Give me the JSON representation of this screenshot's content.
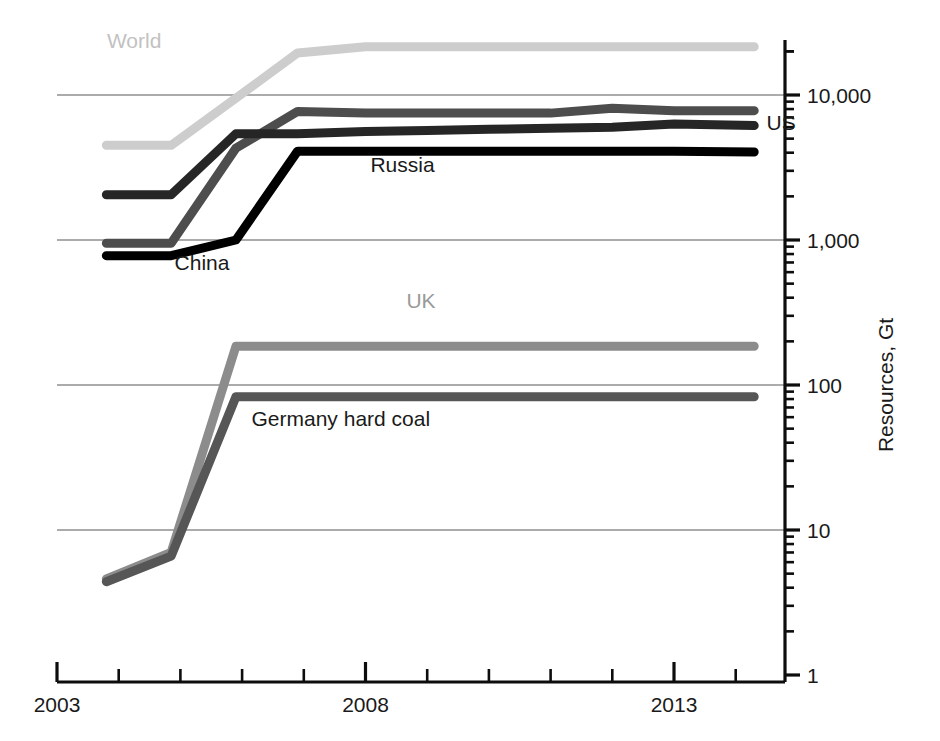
{
  "chart_data": {
    "type": "line",
    "title": "",
    "subtitle": "",
    "xlabel": "",
    "ylabel": "Resources, Gt",
    "y_scale": "log",
    "ylim": [
      1,
      30000
    ],
    "xlim": [
      2003,
      2014.6
    ],
    "grid": true,
    "grid_axis": "y",
    "legend_position": "inline-labels",
    "y_tick_labels": [
      "10,000",
      "1,000",
      "100",
      "10",
      "1"
    ],
    "y_tick_values": [
      10000,
      1000,
      100,
      10,
      1
    ],
    "x_tick_labels": [
      "2003",
      "2008",
      "2013"
    ],
    "x_tick_values": [
      2003,
      2008,
      2013
    ],
    "x_minor_ticks": [
      2004,
      2005,
      2006,
      2007,
      2009,
      2010,
      2011,
      2012,
      2014
    ],
    "series": [
      {
        "name": "World",
        "label": "World",
        "color": "#cdcdcd",
        "label_color": "#c2c2c2",
        "label_x": 2004.25,
        "label_y": 21000,
        "x": [
          2003.8,
          2004.85,
          2005.9,
          2006.9,
          2008.0,
          2009.0,
          2010.0,
          2011.0,
          2012.0,
          2013.0,
          2014.3
        ],
        "y": [
          4500,
          4500,
          9500,
          19500,
          21500,
          21500,
          21500,
          21500,
          21500,
          21500,
          21500
        ]
      },
      {
        "name": "Russia",
        "label": "Russia",
        "color": "#4d4d4d",
        "label_color": "#1a1a1a",
        "label_x": 2008.6,
        "label_y": 2950,
        "x": [
          2003.8,
          2004.85,
          2005.9,
          2006.9,
          2008.0,
          2009.0,
          2010.0,
          2011.0,
          2012.0,
          2013.0,
          2014.3
        ],
        "y": [
          950,
          950,
          4300,
          7700,
          7500,
          7500,
          7500,
          7500,
          8100,
          7800,
          7800
        ]
      },
      {
        "name": "US",
        "label": "US",
        "color": "#262626",
        "label_color": "#1a1a1a",
        "label_x": 2014.5,
        "label_y": 5700,
        "x": [
          2003.8,
          2004.85,
          2005.9,
          2006.9,
          2008.0,
          2009.0,
          2010.0,
          2011.0,
          2012.0,
          2013.0,
          2014.3
        ],
        "y": [
          2050,
          2050,
          5400,
          5400,
          5600,
          5700,
          5800,
          5900,
          6000,
          6300,
          6150
        ]
      },
      {
        "name": "China",
        "label": "China",
        "color": "#000000",
        "label_color": "#1a1a1a",
        "label_x": 2005.35,
        "label_y": 620,
        "x": [
          2003.8,
          2004.85,
          2005.9,
          2006.9,
          2008.0,
          2009.0,
          2010.0,
          2011.0,
          2012.0,
          2013.0,
          2014.3
        ],
        "y": [
          780,
          780,
          1000,
          4100,
          4100,
          4100,
          4100,
          4100,
          4100,
          4100,
          4050
        ]
      },
      {
        "name": "UK",
        "label": "UK",
        "color": "#8c8c8c",
        "label_color": "#9a9a9a",
        "label_x": 2008.9,
        "label_y": 340,
        "x": [
          2003.8,
          2004.85,
          2005.9,
          2006.9,
          2008.0,
          2009.0,
          2010.0,
          2011.0,
          2012.0,
          2013.0,
          2014.3
        ],
        "y": [
          4.6,
          7.0,
          185,
          185,
          185,
          185,
          185,
          185,
          185,
          185,
          185
        ]
      },
      {
        "name": "Germany hard coal",
        "label": "Germany hard coal",
        "color": "#565656",
        "label_color": "#1a1a1a",
        "label_x": 2007.6,
        "label_y": 52,
        "x": [
          2003.8,
          2004.85,
          2005.9,
          2006.9,
          2008.0,
          2009.0,
          2010.0,
          2011.0,
          2012.0,
          2013.0,
          2014.3
        ],
        "y": [
          4.4,
          6.6,
          83,
          83,
          83,
          83,
          83,
          83,
          83,
          83,
          83
        ]
      }
    ],
    "colors": {
      "gridline": "#8f8f8f",
      "axis": "#0d0d0d",
      "text": "#1a1a1a",
      "background": "#ffffff"
    }
  }
}
